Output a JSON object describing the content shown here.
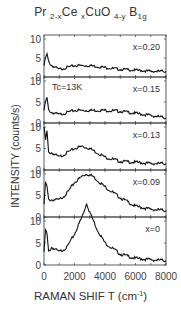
{
  "chart_data": {
    "type": "line",
    "title_parts": {
      "a": "Pr ",
      "a_sub": "2-x",
      "b": "Ce ",
      "b_sub": "x",
      "c": "CuO ",
      "c_sub": "4-y",
      "d": "  B",
      "d_sub": "1g"
    },
    "xlabel": "RAMAN SHIFT (cm-1)",
    "xlabel_main": "RAMAN SHIF   T (cm",
    "xlabel_sup": "-1",
    "xlabel_end": ")",
    "ylabel": "INTENSITY (counts/s)",
    "xlim": [
      0,
      8000
    ],
    "x_ticks": [
      0,
      2000,
      4000,
      6000,
      8000
    ],
    "x_tick_labels": [
      "0",
      "2000",
      "4000",
      "6000",
      "8000"
    ],
    "ylim": [
      0,
      10
    ],
    "y_ticks": [
      0,
      5,
      10
    ],
    "grid": false,
    "annotation": "Tc=13K",
    "panels": [
      {
        "label": "x=0.20",
        "x": [
          0,
          100,
          200,
          300,
          500,
          1000,
          2000,
          3000,
          4000,
          5000,
          6000,
          7000,
          8000
        ],
        "values": [
          3,
          5,
          6,
          4,
          3,
          2,
          3,
          3,
          2.5,
          2,
          1.8,
          1.5,
          1.5
        ]
      },
      {
        "label": "x=0.15",
        "x": [
          0,
          100,
          200,
          300,
          500,
          1000,
          2000,
          3000,
          4000,
          5000,
          6000,
          7000,
          8000
        ],
        "values": [
          3,
          5,
          6,
          3,
          2.5,
          2,
          3,
          3,
          3,
          2.8,
          2.3,
          1.8,
          1.2
        ]
      },
      {
        "label": "x=0.13",
        "x": [
          0,
          100,
          200,
          300,
          500,
          1000,
          2000,
          2500,
          3000,
          3500,
          4000,
          5000,
          6000,
          7000,
          8000
        ],
        "values": [
          10,
          7,
          9,
          4,
          4,
          3,
          5,
          5.5,
          5,
          4,
          3,
          2,
          1.8,
          1.5,
          1.5
        ]
      },
      {
        "label": "x=0.09",
        "x": [
          0,
          100,
          200,
          300,
          500,
          1000,
          1500,
          2000,
          2500,
          2800,
          3200,
          3500,
          4000,
          5000,
          6000,
          7000,
          8000
        ],
        "values": [
          3,
          8,
          7,
          4,
          4,
          4,
          5.5,
          8,
          9.5,
          10,
          9.5,
          8.5,
          7,
          4.5,
          2.5,
          1.8,
          1.5
        ]
      },
      {
        "label": "x=0",
        "x": [
          0,
          100,
          200,
          300,
          500,
          1000,
          1500,
          2000,
          2500,
          2800,
          3000,
          3500,
          4000,
          5000,
          6000,
          7000,
          8000
        ],
        "values": [
          3,
          8,
          7,
          3,
          4,
          3,
          4,
          7,
          11,
          14,
          12,
          8,
          5,
          2.5,
          1.5,
          1.2,
          1
        ]
      }
    ]
  }
}
